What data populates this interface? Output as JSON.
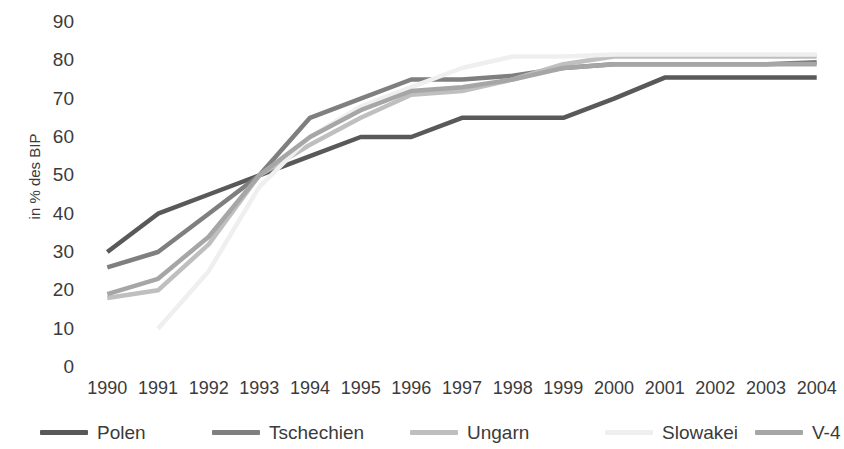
{
  "chart_data": {
    "type": "line",
    "title": "",
    "xlabel": "",
    "ylabel": "in % des BIP",
    "ylim": [
      0,
      90
    ],
    "y_ticks": [
      0,
      10,
      20,
      30,
      40,
      50,
      60,
      70,
      80,
      90
    ],
    "grid": false,
    "legend_position": "bottom",
    "categories": [
      "1990",
      "1991",
      "1992",
      "1993",
      "1994",
      "1995",
      "1996",
      "1997",
      "1998",
      "1999",
      "2000",
      "2001",
      "2002",
      "2003",
      "2004"
    ],
    "series": [
      {
        "name": "Polen",
        "color": "#595959",
        "values": [
          30,
          40,
          45,
          50,
          55,
          60,
          60,
          65,
          65,
          65,
          70,
          75.5,
          75.5,
          75.5,
          75.5
        ]
      },
      {
        "name": "Tschechien",
        "color": "#7f7f7f",
        "values": [
          26,
          30,
          40,
          50,
          65,
          70,
          75,
          75,
          76,
          78,
          79,
          79,
          79,
          79,
          79.5
        ]
      },
      {
        "name": "Ungarn",
        "color": "#bfbfbf",
        "values": [
          18,
          20,
          32,
          50,
          58,
          65,
          71,
          72,
          75,
          79,
          81,
          81,
          81,
          81,
          81
        ]
      },
      {
        "name": "Slowakei",
        "color": "#efefef",
        "values": [
          null,
          10,
          25,
          47,
          60,
          68,
          73,
          78,
          81,
          81,
          81.5,
          81.5,
          81.5,
          81.5,
          81.5
        ]
      },
      {
        "name": "V-4",
        "color": "#a6a6a6",
        "values": [
          19,
          23,
          34,
          50,
          60,
          67,
          72,
          73,
          75,
          78,
          79,
          79,
          79,
          79,
          79
        ]
      }
    ]
  },
  "legend": {
    "items": [
      {
        "label": "Polen",
        "color": "#595959"
      },
      {
        "label": "Tschechien",
        "color": "#7f7f7f"
      },
      {
        "label": "Ungarn",
        "color": "#bfbfbf"
      },
      {
        "label": "Slowakei",
        "color": "#efefef"
      },
      {
        "label": "V-4",
        "color": "#a6a6a6"
      }
    ]
  },
  "axis": {
    "y_title": "in % des BIP"
  }
}
